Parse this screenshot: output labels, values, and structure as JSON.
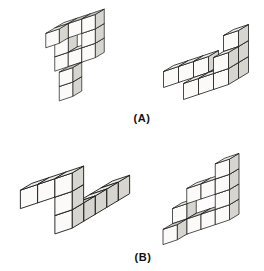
{
  "canvas": {
    "width": 264,
    "height": 271,
    "background": "#ffffff"
  },
  "labels": {
    "a": "(A)",
    "b": "(B)"
  },
  "style": {
    "face_top": "#ebebe7",
    "face_top_shaded": "#c8c8c2",
    "face_front": "#fbfaf8",
    "face_right": "#d7d5d0",
    "stroke": "#1c1c1c",
    "stroke_width": 0.8
  },
  "projection": {
    "x_axis": [
      15,
      -5
    ],
    "y_height": 16,
    "z_axis": [
      -10,
      6
    ]
  },
  "figures": [
    {
      "id": "a-left",
      "pair": "A",
      "description": "P-shaped cube assembly, upright, with forward-jutting cube at top-left and forward two-cube tail at bottom",
      "center": [
        75,
        55
      ],
      "scale": 0.9,
      "cubes": [
        [
          0,
          4,
          0
        ],
        [
          1,
          4,
          0,
          1
        ],
        [
          2,
          4,
          0,
          1
        ],
        [
          0,
          4,
          1
        ],
        [
          0,
          3,
          0
        ],
        [
          2,
          3,
          0
        ],
        [
          0,
          2,
          0
        ],
        [
          1,
          2,
          0
        ],
        [
          2,
          2,
          0
        ],
        [
          1,
          1,
          1,
          1
        ],
        [
          1,
          0,
          1
        ]
      ]
    },
    {
      "id": "a-right",
      "pair": "A",
      "description": "Same assembly rotated: flat base slab, tall stack at right, cantilevered arm to the left with triangular gap",
      "center": [
        206,
        62
      ],
      "scale": 1.0,
      "cubes": [
        [
          -2,
          1,
          0
        ],
        [
          -1,
          1,
          0
        ],
        [
          0,
          1,
          0
        ],
        [
          0,
          0,
          0
        ],
        [
          1,
          0,
          0,
          1
        ],
        [
          2,
          0,
          0
        ],
        [
          0,
          0,
          1
        ],
        [
          1,
          0,
          1
        ],
        [
          2,
          0,
          1
        ],
        [
          2,
          1,
          0
        ],
        [
          2,
          1,
          1
        ],
        [
          2,
          2,
          0
        ]
      ]
    },
    {
      "id": "b-left",
      "pair": "B",
      "description": "Zigzag snake: three-cube arm upper left, two-cube descent, four-cube arm receding to the right",
      "center": [
        75,
        200
      ],
      "scale": 1.15,
      "cubes": [
        [
          -2,
          2,
          0
        ],
        [
          -1,
          2,
          0
        ],
        [
          0,
          2,
          0
        ],
        [
          0,
          1,
          0
        ],
        [
          0,
          0,
          0
        ],
        [
          0,
          0,
          -1,
          1
        ],
        [
          0,
          0,
          -2
        ],
        [
          0,
          0,
          -3
        ],
        [
          0,
          0,
          -4
        ]
      ]
    },
    {
      "id": "b-right",
      "pair": "B",
      "description": "Same snake rotated: base row, left riser with forward-hanging cube, floating upper arm and three-cube wall at right",
      "center": [
        201,
        199
      ],
      "scale": 0.95,
      "cubes": [
        [
          0,
          0,
          0
        ],
        [
          1,
          0,
          0,
          1
        ],
        [
          2,
          0,
          0,
          1
        ],
        [
          3,
          0,
          0
        ],
        [
          0,
          0,
          1,
          1
        ],
        [
          0,
          1,
          0
        ],
        [
          3,
          1,
          0
        ],
        [
          3,
          2,
          0
        ],
        [
          3,
          3,
          0
        ],
        [
          1,
          2,
          0
        ],
        [
          2,
          2,
          0
        ]
      ]
    }
  ]
}
